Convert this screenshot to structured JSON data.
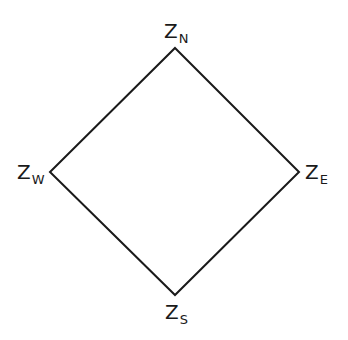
{
  "diagram": {
    "shape": "diamond",
    "stroke_color": "#1a1a1a",
    "stroke_width": 2,
    "vertices": {
      "north": {
        "x": 175,
        "y": 48
      },
      "east": {
        "x": 299,
        "y": 172
      },
      "south": {
        "x": 175,
        "y": 295
      },
      "west": {
        "x": 50,
        "y": 172
      }
    },
    "labels": {
      "north": {
        "main": "Z",
        "sub": "N"
      },
      "west": {
        "main": "Z",
        "sub": "W"
      },
      "east": {
        "main": "Z",
        "sub": "E"
      },
      "south": {
        "main": "Z",
        "sub": "S"
      }
    }
  }
}
